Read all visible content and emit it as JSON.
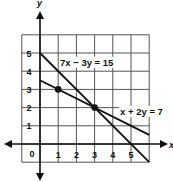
{
  "chart_data": {
    "type": "line",
    "title": "",
    "xlabel": "x",
    "ylabel": "y",
    "xlim": [
      -1,
      6
    ],
    "ylim": [
      -1,
      6
    ],
    "grid": true,
    "x_ticks": [
      "1",
      "2",
      "3",
      "4",
      "5"
    ],
    "y_ticks": [
      "1",
      "2",
      "3",
      "4",
      "5"
    ],
    "origin_label": "0",
    "series": [
      {
        "name": "7x − 3y = 15",
        "label": "7x − 3y = 15",
        "points": [
          [
            0,
            5
          ],
          [
            6,
            -1
          ]
        ],
        "label_pos": [
          1.1,
          4.3
        ]
      },
      {
        "name": "x + 2y = 7",
        "label": "x + 2y = 7",
        "points": [
          [
            0,
            3.5
          ],
          [
            6,
            0.5
          ]
        ],
        "label_pos": [
          4.4,
          1.6
        ]
      }
    ],
    "marked_points": [
      [
        1,
        3
      ],
      [
        3,
        2
      ]
    ],
    "colors": {
      "line": "#111111",
      "grid": "#555555",
      "background": "#ffffff"
    }
  }
}
